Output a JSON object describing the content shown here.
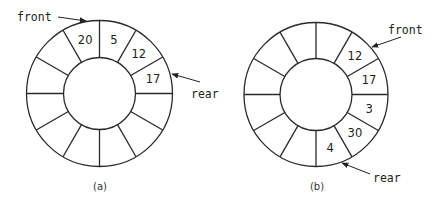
{
  "diagrams": [
    {
      "id": "a",
      "caption": "(a)",
      "center": [
        99.5,
        93.5
      ],
      "outer_radius": 73,
      "inner_radius": 36,
      "segments": 12,
      "cells": [
        {
          "index": 11,
          "value": "20"
        },
        {
          "index": 0,
          "value": "5"
        },
        {
          "index": 1,
          "value": "12"
        },
        {
          "index": 2,
          "value": "17"
        }
      ],
      "front_label": "front",
      "rear_label": "rear"
    },
    {
      "id": "b",
      "caption": "(b)",
      "center": [
        316,
        94.5
      ],
      "outer_radius": 72,
      "inner_radius": 36,
      "segments": 12,
      "cells": [
        {
          "index": 1,
          "value": "12"
        },
        {
          "index": 2,
          "value": "17"
        },
        {
          "index": 3,
          "value": "3"
        },
        {
          "index": 4,
          "value": "30"
        },
        {
          "index": 5,
          "value": "4"
        }
      ],
      "front_label": "front",
      "rear_label": "rear"
    }
  ],
  "colors": {
    "stroke": "#2a2a2a",
    "text": "#222222",
    "background": "#ffffff"
  }
}
